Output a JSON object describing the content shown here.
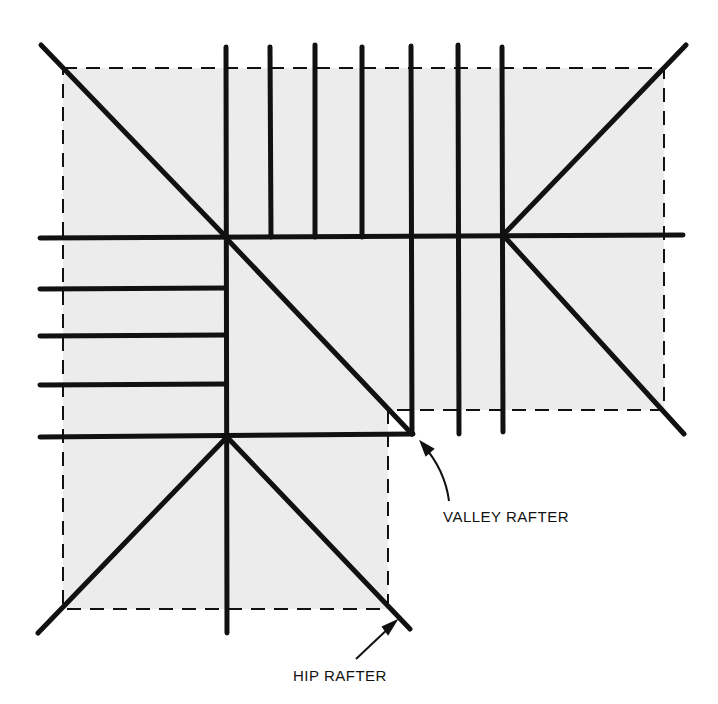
{
  "diagram": {
    "type": "roof-framing-plan",
    "colors": {
      "stroke": "#111111",
      "fill": "#ececec",
      "background": "#ffffff"
    },
    "labels": {
      "valley_rafter": "VALLEY RAFTER",
      "hip_rafter": "HIP RAFTER"
    }
  }
}
